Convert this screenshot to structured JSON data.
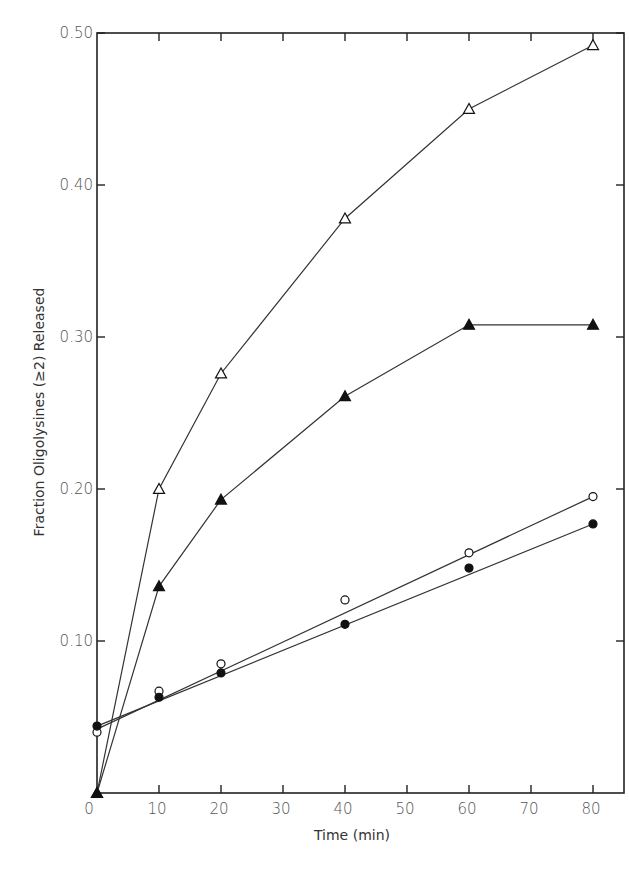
{
  "chart_data": {
    "type": "line",
    "title": "",
    "xlabel": "Time (min)",
    "ylabel": "Fraction Oligolysines (≥2) Released",
    "xlim": [
      0,
      85
    ],
    "ylim": [
      0,
      0.5
    ],
    "x_ticks": [
      0,
      10,
      20,
      30,
      40,
      50,
      60,
      70,
      80
    ],
    "x_tick_labels": [
      "0",
      "10",
      "20",
      "30",
      "40",
      "50",
      "60",
      "70",
      "80"
    ],
    "y_ticks": [
      0.1,
      0.2,
      0.3,
      0.4,
      0.5
    ],
    "y_tick_labels": [
      "0.10",
      "0.20",
      "0.30",
      "0.40",
      "0.50"
    ],
    "grid": false,
    "legend": null,
    "series": [
      {
        "name": "open-triangle",
        "marker": "triangle-open",
        "line": "connect",
        "x": [
          0,
          10,
          20,
          40,
          60,
          80
        ],
        "values": [
          0.0,
          0.2,
          0.276,
          0.378,
          0.45,
          0.492
        ]
      },
      {
        "name": "filled-triangle",
        "marker": "triangle-filled",
        "line": "connect",
        "x": [
          0,
          10,
          20,
          40,
          60,
          80
        ],
        "values": [
          0.0,
          0.136,
          0.193,
          0.261,
          0.308,
          0.308
        ]
      },
      {
        "name": "open-circle",
        "marker": "circle-open",
        "line": "fit",
        "fit": [
          0.042,
          0.195
        ],
        "x": [
          0,
          10,
          20,
          40,
          60,
          80
        ],
        "values": [
          0.04,
          0.067,
          0.085,
          0.127,
          0.158,
          0.195
        ]
      },
      {
        "name": "filled-circle",
        "marker": "circle-filled",
        "line": "fit",
        "fit": [
          0.044,
          0.177
        ],
        "x": [
          0,
          10,
          20,
          40,
          60,
          80
        ],
        "values": [
          0.044,
          0.063,
          0.079,
          0.111,
          0.148,
          0.177
        ]
      }
    ]
  }
}
